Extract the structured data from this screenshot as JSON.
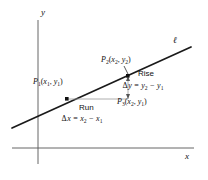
{
  "figure": {
    "axes": {
      "y_axis_label": "y",
      "x_axis_label": "x"
    },
    "line": {
      "label": "ℓ"
    },
    "points": [
      {
        "name": "P1",
        "label": "P",
        "subscript": "1",
        "coords": "(x₁, y₁)"
      },
      {
        "name": "P2",
        "label": "P",
        "subscript": "2",
        "coords": "(x₂, y₂)"
      },
      {
        "name": "P3",
        "label": "P",
        "subscript": "3",
        "coords": "(x₂, y₁)"
      }
    ],
    "p1": {
      "base": "P",
      "sub": "1",
      "open": "(",
      "x": "x",
      "xsub": "1",
      "comma": ", ",
      "y": "y",
      "ysub": "1",
      "close": ")"
    },
    "p2": {
      "base": "P",
      "sub": "2",
      "open": "(",
      "x": "x",
      "xsub": "2",
      "comma": ", ",
      "y": "y",
      "ysub": "2",
      "close": ")"
    },
    "p3": {
      "base": "P",
      "sub": "3",
      "open": "(",
      "x": "x",
      "xsub": "2",
      "comma": ", ",
      "y": "y",
      "ysub": "1",
      "close": ")"
    },
    "rise": {
      "term": "Rise",
      "delta": "Δ",
      "var": "y",
      "equals": " = ",
      "t1": "y",
      "t1sub": "2",
      "minus": " − ",
      "t2": "y",
      "t2sub": "1"
    },
    "run": {
      "term": "Run",
      "delta": "Δ",
      "var": "x",
      "equals": " = ",
      "t1": "x",
      "t1sub": "2",
      "minus": " − ",
      "t2": "x",
      "t2sub": "1"
    },
    "colors": {
      "ink": "#111111",
      "axis": "#555555",
      "leg": "#888888",
      "background": "#ffffff"
    }
  }
}
